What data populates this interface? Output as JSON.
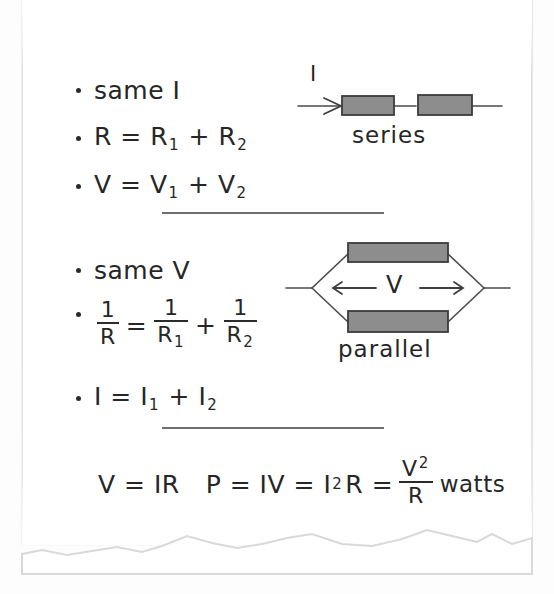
{
  "document": {
    "type": "handwritten-notes",
    "topic": "Resistors in series and parallel",
    "ink_color": "#262626",
    "paper_color": "#ffffff",
    "resistor_fill": "#8d8d8d",
    "wire_color": "#4a4a4a"
  },
  "series_section": {
    "bullets": [
      {
        "text": "same I"
      },
      {
        "prefix": "R = R",
        "sub1": "1",
        "mid": " + R",
        "sub2": "2"
      },
      {
        "prefix": "V = V",
        "sub1": "1",
        "mid": " + V",
        "sub2": "2"
      }
    ],
    "diagram": {
      "current_label": "I",
      "caption": "series",
      "resistor_count": 2
    }
  },
  "parallel_section": {
    "bullets": [
      {
        "text": "same V"
      },
      {
        "fraction_equation": {
          "left": {
            "num": "1",
            "den": "R"
          },
          "eq": "=",
          "term1": {
            "num": "1",
            "den": "R",
            "den_sub": "1"
          },
          "plus": "+",
          "term2": {
            "num": "1",
            "den": "R",
            "den_sub": "2"
          }
        }
      },
      {
        "prefix": "I = I",
        "sub1": "1",
        "mid": " + I",
        "sub2": "2"
      }
    ],
    "diagram": {
      "voltage_label": "V",
      "left_arrow": "←",
      "right_arrow": "→",
      "caption": "parallel",
      "resistor_count": 2
    }
  },
  "bottom_equations": {
    "ohms_law": "V = IR",
    "power_prefix": "P = IV = I",
    "power_exp": "2",
    "power_mid": "R =",
    "power_frac": {
      "num": "V",
      "num_exp": "2",
      "den": "R"
    },
    "units": "watts"
  }
}
